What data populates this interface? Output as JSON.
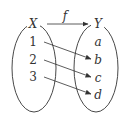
{
  "diagram": {
    "type": "function-mapping",
    "function_label": "f",
    "domain": {
      "label": "X",
      "elements": [
        "1",
        "2",
        "3"
      ]
    },
    "codomain": {
      "label": "Y",
      "elements": [
        "a",
        "b",
        "c",
        "d"
      ]
    },
    "mappings": [
      {
        "from": "1",
        "to": "b"
      },
      {
        "from": "2",
        "to": "c"
      },
      {
        "from": "3",
        "to": "d"
      }
    ],
    "colors": {
      "stroke": "#333333",
      "background": "#ffffff"
    }
  }
}
